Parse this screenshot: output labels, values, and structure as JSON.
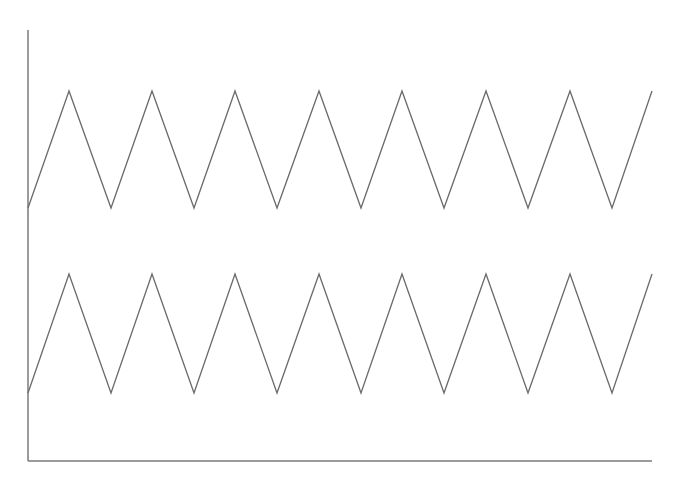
{
  "chart_data": {
    "type": "line",
    "title": "",
    "xlabel": "",
    "ylabel": "",
    "grid": false,
    "legend": null,
    "x": [
      0,
      1,
      2,
      3,
      4,
      5,
      6,
      7,
      8,
      9,
      10,
      11,
      12,
      13,
      14,
      15
    ],
    "series": [
      {
        "name": "upper-triangle-wave",
        "values": [
          0,
          1,
          0,
          1,
          0,
          1,
          0,
          1,
          0,
          1,
          0,
          1,
          0,
          1,
          0,
          1
        ],
        "offset": 2
      },
      {
        "name": "lower-triangle-wave",
        "values": [
          0,
          1,
          0,
          1,
          0,
          1,
          0,
          1,
          0,
          1,
          0,
          1,
          0,
          1,
          0,
          1
        ],
        "offset": 0
      }
    ],
    "colors": {
      "line": "#6a6a6a",
      "axis": "#7a7a7a"
    }
  },
  "layout": {
    "axis_origin": [
      28,
      461
    ],
    "axis_top": 30,
    "axis_right": 652,
    "x_px": [
      28,
      69,
      111,
      152,
      194,
      235,
      277,
      319,
      361,
      402,
      444,
      486,
      528,
      570,
      612,
      652
    ],
    "upper": {
      "low_y": 208,
      "high_y": 91
    },
    "lower": {
      "low_y": 393,
      "high_y": 274
    }
  }
}
